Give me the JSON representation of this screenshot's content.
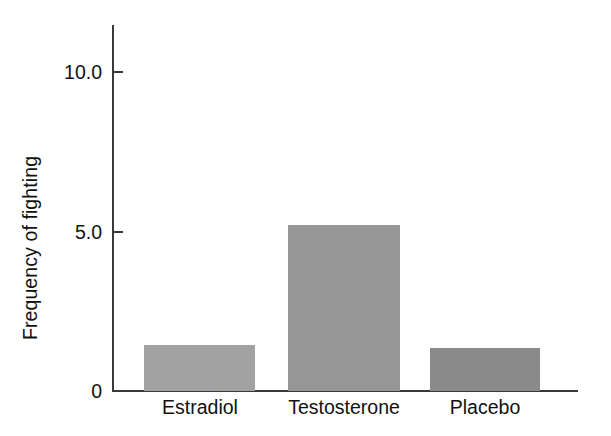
{
  "chart_data": {
    "type": "bar",
    "title": "",
    "xlabel": "",
    "ylabel": "Frequency of fighting",
    "categories": [
      "Estradiol",
      "Testosterone",
      "Placebo"
    ],
    "values": [
      1.45,
      5.2,
      1.35
    ],
    "ylim": [
      0,
      11.5
    ],
    "yticks": [
      "0",
      "5.0",
      "10.0"
    ],
    "ytick_values": [
      0,
      5.0,
      10.0
    ],
    "grid": false,
    "legend": null,
    "bar_colors": [
      "#a2a2a2",
      "#969696",
      "#8a8a8a"
    ],
    "axis_color": "#3a3a3a",
    "background": "#ffffff"
  },
  "axis": {
    "y_label": "Frequency of fighting",
    "tick_0": "0",
    "tick_5": "5.0",
    "tick_10": "10.0"
  },
  "bars": [
    {
      "label": "Estradiol",
      "value": 1.45,
      "color": "#a2a2a2"
    },
    {
      "label": "Testosterone",
      "value": 5.2,
      "color": "#969696"
    },
    {
      "label": "Placebo",
      "value": 1.35,
      "color": "#8a8a8a"
    }
  ]
}
